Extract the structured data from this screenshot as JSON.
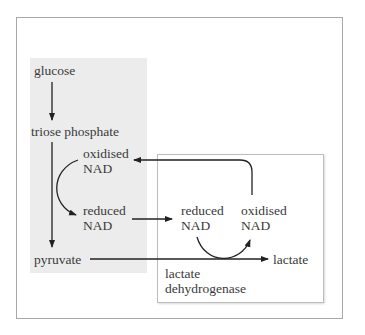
{
  "diagram": {
    "type": "biochemical-pathway",
    "nodes": {
      "glucose": "glucose",
      "triose_phosphate": "triose phosphate",
      "oxidised_nad_left_1": "oxidised",
      "oxidised_nad_left_2": "NAD",
      "reduced_nad_left_1": "reduced",
      "reduced_nad_left_2": "NAD",
      "pyruvate": "pyruvate",
      "reduced_nad_right_1": "reduced",
      "reduced_nad_right_2": "NAD",
      "oxidised_nad_right_1": "oxidised",
      "oxidised_nad_right_2": "NAD",
      "lactate": "lactate",
      "enzyme_1": "lactate",
      "enzyme_2": "dehydrogenase"
    },
    "edges": [
      {
        "from": "glucose",
        "to": "triose phosphate"
      },
      {
        "from": "triose phosphate",
        "to": "pyruvate"
      },
      {
        "from": "oxidised NAD (glycolysis)",
        "to": "reduced NAD (glycolysis)"
      },
      {
        "from": "reduced NAD (glycolysis)",
        "to": "reduced NAD (lactate)"
      },
      {
        "from": "reduced NAD (lactate)",
        "to": "oxidised NAD (lactate)"
      },
      {
        "from": "oxidised NAD (lactate)",
        "to": "oxidised NAD (glycolysis)"
      },
      {
        "from": "pyruvate",
        "to": "lactate",
        "enzyme": "lactate dehydrogenase"
      }
    ],
    "colors": {
      "panel": "#ececec",
      "arrow": "#222222",
      "text": "#3a3a3a",
      "border": "#a8a8a8"
    }
  }
}
